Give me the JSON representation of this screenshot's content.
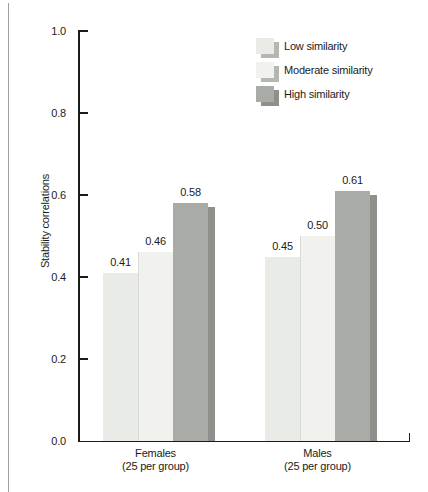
{
  "chart_data": {
    "type": "bar",
    "title": "",
    "xlabel": "",
    "ylabel": "Stability correlations",
    "ylim": [
      0,
      1
    ],
    "grid": false,
    "yticks": [
      1.0,
      0.8,
      0.6,
      0.4,
      0.2,
      0.0
    ],
    "ytick_labels": [
      "1.0",
      "0.8",
      "0.6",
      "0.4",
      "0.2",
      "0.0"
    ],
    "categories": [
      "Females (25 per group)",
      "Males (25 per group)"
    ],
    "category_labels": [
      [
        "Females",
        "(25 per group)"
      ],
      [
        "Males",
        "(25 per group)"
      ]
    ],
    "series": [
      {
        "name": "Low similarity",
        "values": [
          0.41,
          0.45
        ],
        "labels": [
          "0.41",
          "0.45"
        ]
      },
      {
        "name": "Moderate similarity",
        "values": [
          0.46,
          0.5
        ],
        "labels": [
          "0.46",
          "0.50"
        ]
      },
      {
        "name": "High similarity",
        "values": [
          0.58,
          0.61
        ],
        "labels": [
          "0.58",
          "0.61"
        ]
      }
    ],
    "legend": {
      "position": "upper-right",
      "entries": [
        "Low similarity",
        "Moderate similarity",
        "High similarity"
      ]
    }
  },
  "colors": {
    "background": "#ffffff",
    "axis": "#1b1b1b",
    "page_border": "#9da29d",
    "bar_low": "#e9ebe6",
    "bar_moderate": "#f1f2ee",
    "bar_high": "#a8aba6",
    "bar_seam": "#d9dbd6",
    "shadow_light": "#b4b7b2",
    "shadow_dark": "#8d908b"
  }
}
